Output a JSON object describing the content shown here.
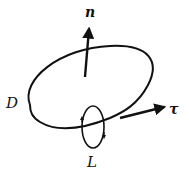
{
  "diagram": {
    "labels": {
      "normal": "n",
      "tangent": "τ",
      "domain": "D",
      "loop": "L"
    },
    "colors": {
      "stroke": "#111111",
      "background": "#ffffff"
    }
  }
}
